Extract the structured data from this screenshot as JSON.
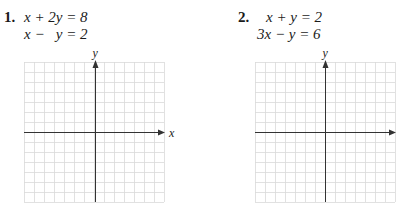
{
  "problems": [
    {
      "number": "1.",
      "equations": [
        "x + 2y = 8",
        "x −   y = 2"
      ],
      "graph": {
        "x_label": "x",
        "y_label": "y",
        "grid": {
          "left": 24,
          "top": 62,
          "cols": 14,
          "rows": 14,
          "cell": 10
        },
        "origin": {
          "x": 95,
          "y": 132
        }
      }
    },
    {
      "number": "2.",
      "equations": [
        "x + y = 2",
        "3x − y = 6"
      ],
      "graph": {
        "x_label": "x",
        "y_label": "y",
        "grid": {
          "left": 255,
          "top": 62,
          "cols": 14,
          "rows": 14,
          "cell": 10
        },
        "origin": {
          "x": 325,
          "y": 132
        }
      }
    }
  ],
  "colors": {
    "grid_line": "#d9d9d9",
    "axis": "#333333",
    "text": "#1a1a1a"
  }
}
